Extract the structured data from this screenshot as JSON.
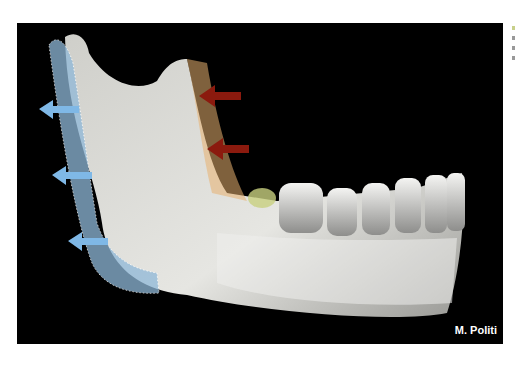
{
  "figure": {
    "credit": "M. Politi",
    "annotations": {
      "blue_arrows": 3,
      "red_arrows": 2,
      "blue_region": "posterior ramus border (dotted outline)",
      "orange_region": "anterior ramus/coronoid area"
    },
    "colors": {
      "background": "#000000",
      "bone": "#d8d8d4",
      "blue_overlay": "#8fb8d8",
      "blue_arrow": "#7fb8e6",
      "red_arrow": "#8b1a0e",
      "orange_overlay": "#e8b070"
    }
  }
}
